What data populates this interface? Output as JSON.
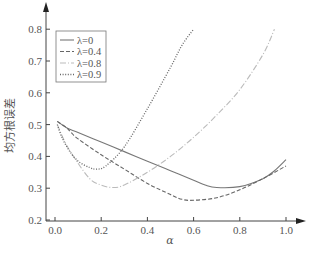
{
  "chart_data": {
    "type": "line",
    "title": "",
    "xlabel": "α",
    "ylabel": "均方根误差",
    "xlim": [
      0.0,
      1.0
    ],
    "ylim": [
      0.2,
      0.8
    ],
    "xticks": [
      "0.0",
      "0.2",
      "0.4",
      "0.6",
      "0.8",
      "1.0"
    ],
    "yticks": [
      "0.2",
      "0.3",
      "0.4",
      "0.5",
      "0.6",
      "0.7",
      "0.8"
    ],
    "grid": false,
    "legend_position": "upper-left",
    "series": [
      {
        "name": "λ=0",
        "style": "solid",
        "color": "#777777",
        "x": [
          0.01,
          0.05,
          0.1,
          0.2,
          0.3,
          0.4,
          0.5,
          0.6,
          0.65,
          0.7,
          0.8,
          0.9,
          0.95,
          1.0
        ],
        "y": [
          0.51,
          0.49,
          0.475,
          0.445,
          0.415,
          0.385,
          0.355,
          0.325,
          0.31,
          0.302,
          0.305,
          0.33,
          0.355,
          0.39
        ]
      },
      {
        "name": "λ=0.4",
        "style": "dashed",
        "color": "#666666",
        "x": [
          0.01,
          0.05,
          0.07,
          0.1,
          0.2,
          0.3,
          0.4,
          0.5,
          0.55,
          0.6,
          0.7,
          0.8,
          0.9,
          1.0
        ],
        "y": [
          0.51,
          0.49,
          0.475,
          0.455,
          0.405,
          0.36,
          0.315,
          0.28,
          0.265,
          0.262,
          0.27,
          0.295,
          0.33,
          0.37
        ]
      },
      {
        "name": "λ=0.8",
        "style": "dashdot",
        "color": "#bbbbbb",
        "x": [
          0.01,
          0.04,
          0.08,
          0.15,
          0.2,
          0.25,
          0.3,
          0.4,
          0.5,
          0.6,
          0.7,
          0.8,
          0.9,
          0.95
        ],
        "y": [
          0.5,
          0.45,
          0.4,
          0.33,
          0.31,
          0.302,
          0.31,
          0.35,
          0.4,
          0.46,
          0.53,
          0.61,
          0.72,
          0.8
        ]
      },
      {
        "name": "λ=0.9",
        "style": "dotted",
        "color": "#666666",
        "x": [
          0.01,
          0.03,
          0.06,
          0.1,
          0.15,
          0.18,
          0.22,
          0.3,
          0.4,
          0.5,
          0.55,
          0.6
        ],
        "y": [
          0.5,
          0.46,
          0.42,
          0.385,
          0.365,
          0.36,
          0.37,
          0.43,
          0.55,
          0.68,
          0.75,
          0.8
        ]
      }
    ]
  },
  "axes": {
    "x_label": "α",
    "y_label": "均方根误差"
  },
  "legend": {
    "items": [
      {
        "label": "λ=0"
      },
      {
        "label": "λ=0.4"
      },
      {
        "label": "λ=0.8"
      },
      {
        "label": "λ=0.9"
      }
    ]
  }
}
